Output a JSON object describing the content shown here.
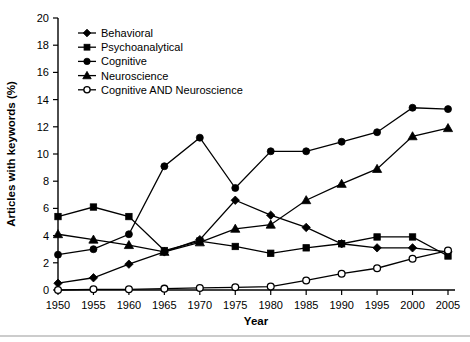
{
  "chart_data": {
    "type": "line",
    "title": "",
    "xlabel": "Year",
    "ylabel": "Articles with keywords (%)",
    "x": [
      1950,
      1955,
      1960,
      1965,
      1970,
      1975,
      1980,
      1985,
      1990,
      1995,
      2000,
      2005
    ],
    "xtick_labels": [
      "1950",
      "1955",
      "1960",
      "1965",
      "1970",
      "1975",
      "1980",
      "1985",
      "1990",
      "1995",
      "2000",
      "2005"
    ],
    "ytick_labels": [
      "0",
      "2",
      "4",
      "6",
      "8",
      "10",
      "12",
      "14",
      "16",
      "18",
      "20"
    ],
    "yticks": [
      0,
      2,
      4,
      6,
      8,
      10,
      12,
      14,
      16,
      18,
      20
    ],
    "xlim": [
      1950,
      2005
    ],
    "ylim": [
      0,
      20
    ],
    "grid": false,
    "legend_position": "top-left-inside",
    "series": [
      {
        "name": "Behavioral",
        "marker": "diamond",
        "values": [
          0.5,
          0.9,
          1.9,
          2.8,
          3.7,
          6.6,
          5.5,
          4.6,
          3.4,
          3.1,
          3.1,
          2.8
        ]
      },
      {
        "name": "Psychoanalytical",
        "marker": "square",
        "values": [
          5.4,
          6.1,
          5.4,
          2.9,
          3.6,
          3.2,
          2.7,
          3.1,
          3.4,
          3.9,
          3.9,
          2.5
        ]
      },
      {
        "name": "Cognitive",
        "marker": "circle",
        "values": [
          2.6,
          3.0,
          4.1,
          9.1,
          11.2,
          7.5,
          10.2,
          10.2,
          10.9,
          11.6,
          13.4,
          13.3
        ]
      },
      {
        "name": "Neuroscience",
        "marker": "triangle",
        "values": [
          4.1,
          3.7,
          3.3,
          2.8,
          3.5,
          4.5,
          4.8,
          6.6,
          7.8,
          8.9,
          11.3,
          11.9
        ]
      },
      {
        "name": "Cognitive AND Neuroscience",
        "marker": "open-circle",
        "values": [
          0.0,
          0.05,
          0.05,
          0.1,
          0.15,
          0.2,
          0.25,
          0.7,
          1.2,
          1.6,
          2.3,
          2.9
        ]
      }
    ]
  }
}
